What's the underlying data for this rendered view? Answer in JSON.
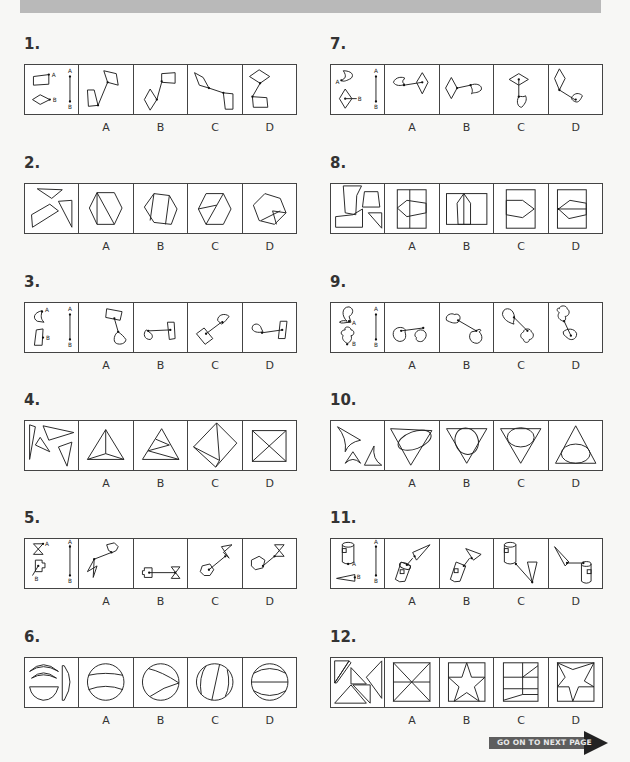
{
  "header_bar": {
    "color": "#b9b9b9"
  },
  "questions": [
    {
      "number": "1.",
      "options": [
        "A",
        "B",
        "C",
        "D"
      ],
      "description": "Connect quadrilateral (point A) and rhombus (point B) via line A-B"
    },
    {
      "number": "2.",
      "options": [
        "A",
        "B",
        "C",
        "D"
      ],
      "description": "Assemble triangle pieces and quadrilateral into a hexagon"
    },
    {
      "number": "3.",
      "options": [
        "A",
        "B",
        "C",
        "D"
      ],
      "description": "Connect heart-like shape (A) and rectangle (B) via line A-B"
    },
    {
      "number": "4.",
      "options": [
        "A",
        "B",
        "C",
        "D"
      ],
      "description": "Assemble four triangles into a shape"
    },
    {
      "number": "5.",
      "options": [
        "A",
        "B",
        "C",
        "D"
      ],
      "description": "Connect hourglass (A) and cog shape (B) via line A-B"
    },
    {
      "number": "6.",
      "options": [
        "A",
        "B",
        "C",
        "D"
      ],
      "description": "Assemble circle segments into a circle"
    },
    {
      "number": "7.",
      "options": [
        "A",
        "B",
        "C",
        "D"
      ],
      "description": "Connect hook shape (A) and rhombus (B) via line A-B"
    },
    {
      "number": "8.",
      "options": [
        "A",
        "B",
        "C",
        "D"
      ],
      "description": "Assemble irregular pieces into a rectangle"
    },
    {
      "number": "9.",
      "options": [
        "A",
        "B",
        "C",
        "D"
      ],
      "description": "Connect blob shape (A) and cloud shape (B) via line A-B"
    },
    {
      "number": "10.",
      "options": [
        "A",
        "B",
        "C",
        "D"
      ],
      "description": "Assemble curved pieces into triangle with ellipse"
    },
    {
      "number": "11.",
      "options": [
        "A",
        "B",
        "C",
        "D"
      ],
      "description": "Connect cylinder (A) and cone (B) via line A-B"
    },
    {
      "number": "12.",
      "options": [
        "A",
        "B",
        "C",
        "D"
      ],
      "description": "Assemble triangle pieces into a square"
    }
  ],
  "footer": {
    "next_page_label": "GO ON TO NEXT PAGE"
  }
}
